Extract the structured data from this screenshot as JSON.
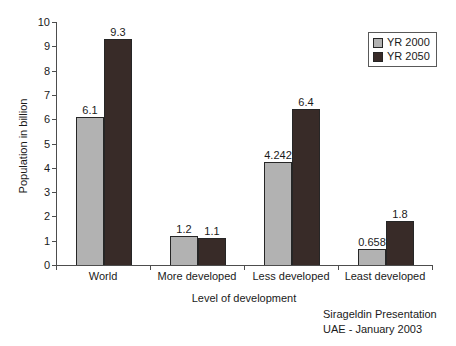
{
  "chart_data": {
    "type": "bar",
    "title": "",
    "categories": [
      "World",
      "More developed",
      "Less developed",
      "Least developed"
    ],
    "series": [
      {
        "name": "YR 2000",
        "color": "#b2b2b2",
        "values": [
          6.1,
          1.2,
          4.242,
          0.658
        ]
      },
      {
        "name": "YR 2050",
        "color": "#382b28",
        "values": [
          9.3,
          1.1,
          6.4,
          1.8
        ]
      }
    ],
    "xlabel": "Level of development",
    "ylabel": "Population in billion",
    "ylim": [
      0,
      10
    ],
    "ytick_step": 1,
    "ytick_labels": [
      "0",
      "1",
      "2",
      "3",
      "4",
      "5",
      "6",
      "7",
      "8",
      "9",
      "10"
    ],
    "legend_position": "top-right",
    "grid": false
  },
  "footer": {
    "line1": "Sirageldin Presentation",
    "line2": "UAE - January 2003"
  }
}
